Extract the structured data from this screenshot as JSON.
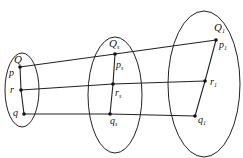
{
  "diagram": {
    "sets": [
      {
        "label": "Q",
        "subscript": "",
        "points": [
          {
            "label": "p",
            "sub": ""
          },
          {
            "label": "r",
            "sub": ""
          },
          {
            "label": "q",
            "sub": ""
          }
        ]
      },
      {
        "label": "Q",
        "subscript": "s",
        "points": [
          {
            "label": "p",
            "sub": "s"
          },
          {
            "label": "r",
            "sub": "s"
          },
          {
            "label": "q",
            "sub": "s"
          }
        ]
      },
      {
        "label": "Q",
        "subscript": "1",
        "points": [
          {
            "label": "p",
            "sub": "1"
          },
          {
            "label": "r",
            "sub": "1"
          },
          {
            "label": "q",
            "sub": "1"
          }
        ]
      }
    ],
    "connections": [
      "p-p_s-p_1",
      "r-r_s-r_1",
      "q-q_s-q_1"
    ]
  }
}
